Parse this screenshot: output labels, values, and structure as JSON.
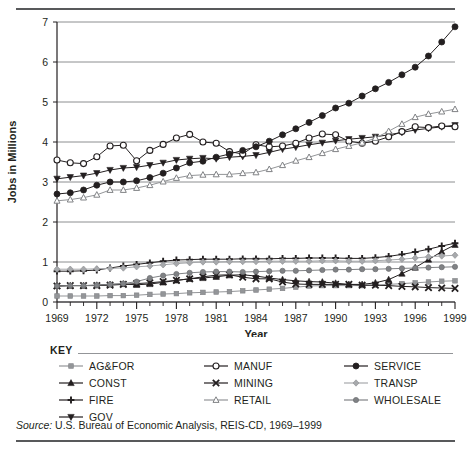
{
  "figure": {
    "source_prefix": "Source:",
    "source_text": " U.S. Bureau of Economic Analysis, REIS-CD, 1969–1999",
    "key_title": "KEY"
  },
  "chart_data": {
    "type": "line",
    "title": "",
    "xlabel": "Year",
    "ylabel": "Jobs in Millions",
    "xlim": [
      1969,
      1999
    ],
    "ylim": [
      0,
      7
    ],
    "yticks": [
      0,
      1,
      2,
      3,
      4,
      5,
      6,
      7
    ],
    "xticks": [
      1969,
      1972,
      1975,
      1978,
      1981,
      1984,
      1987,
      1990,
      1993,
      1996,
      1999
    ],
    "xtick_labels": [
      "1969",
      "1972",
      "1975",
      "1978",
      "1981",
      "1984",
      "1987",
      "1990",
      "1993",
      "1996",
      "1999"
    ],
    "ytick_labels": [
      "0",
      "1",
      "2",
      "3",
      "4",
      "5",
      "6",
      "7"
    ],
    "grid": "horizontal",
    "legend_position": "below-plot",
    "x": [
      1969,
      1970,
      1971,
      1972,
      1973,
      1974,
      1975,
      1976,
      1977,
      1978,
      1979,
      1980,
      1981,
      1982,
      1983,
      1984,
      1985,
      1986,
      1987,
      1988,
      1989,
      1990,
      1991,
      1992,
      1993,
      1994,
      1995,
      1996,
      1997,
      1998,
      1999
    ],
    "series": [
      {
        "name": "AG&FOR",
        "marker": "circle-small-gray",
        "color": "#939598",
        "values": [
          0.15,
          0.15,
          0.15,
          0.15,
          0.16,
          0.16,
          0.17,
          0.19,
          0.2,
          0.21,
          0.23,
          0.24,
          0.25,
          0.26,
          0.28,
          0.3,
          0.32,
          0.34,
          0.37,
          0.4,
          0.41,
          0.41,
          0.41,
          0.41,
          0.42,
          0.44,
          0.46,
          0.48,
          0.5,
          0.52,
          0.53
        ]
      },
      {
        "name": "CONST",
        "marker": "triangle-up",
        "color": "#231f20",
        "values": [
          0.4,
          0.41,
          0.41,
          0.42,
          0.44,
          0.45,
          0.43,
          0.45,
          0.49,
          0.54,
          0.58,
          0.6,
          0.63,
          0.67,
          0.68,
          0.65,
          0.6,
          0.56,
          0.53,
          0.51,
          0.5,
          0.47,
          0.44,
          0.44,
          0.48,
          0.56,
          0.71,
          0.86,
          1.06,
          1.26,
          1.43
        ]
      },
      {
        "name": "FIRE",
        "marker": "plus",
        "color": "#231f20",
        "values": [
          0.77,
          0.77,
          0.78,
          0.8,
          0.85,
          0.9,
          0.94,
          0.98,
          1.02,
          1.05,
          1.06,
          1.07,
          1.07,
          1.07,
          1.08,
          1.08,
          1.08,
          1.09,
          1.09,
          1.1,
          1.1,
          1.1,
          1.09,
          1.09,
          1.11,
          1.14,
          1.19,
          1.25,
          1.32,
          1.4,
          1.47
        ]
      },
      {
        "name": "GOV",
        "marker": "triangle-down",
        "color": "#231f20",
        "values": [
          3.08,
          3.12,
          3.16,
          3.22,
          3.3,
          3.35,
          3.37,
          3.42,
          3.48,
          3.55,
          3.58,
          3.6,
          3.58,
          3.62,
          3.64,
          3.67,
          3.74,
          3.82,
          3.87,
          3.93,
          3.98,
          4.03,
          4.07,
          4.1,
          4.13,
          4.18,
          4.24,
          4.3,
          4.34,
          4.38,
          4.42
        ]
      },
      {
        "name": "MANUF",
        "marker": "circle-open",
        "color": "#231f20",
        "values": [
          3.55,
          3.48,
          3.46,
          3.63,
          3.9,
          3.92,
          3.53,
          3.79,
          3.94,
          4.1,
          4.19,
          4.0,
          3.97,
          3.76,
          3.7,
          3.93,
          3.88,
          3.9,
          3.97,
          4.1,
          4.2,
          4.18,
          4.02,
          3.97,
          4.02,
          4.13,
          4.26,
          4.38,
          4.36,
          4.4,
          4.38
        ]
      },
      {
        "name": "MINING",
        "marker": "cross-x",
        "color": "#231f20",
        "values": [
          0.4,
          0.41,
          0.41,
          0.41,
          0.42,
          0.44,
          0.46,
          0.48,
          0.51,
          0.54,
          0.58,
          0.63,
          0.67,
          0.68,
          0.62,
          0.58,
          0.58,
          0.5,
          0.45,
          0.44,
          0.44,
          0.44,
          0.44,
          0.42,
          0.42,
          0.41,
          0.39,
          0.38,
          0.36,
          0.35,
          0.34
        ]
      },
      {
        "name": "RETAIL",
        "marker": "triangle-open",
        "color": "#939598",
        "values": [
          2.53,
          2.56,
          2.61,
          2.68,
          2.8,
          2.8,
          2.85,
          2.92,
          3.01,
          3.1,
          3.16,
          3.18,
          3.19,
          3.19,
          3.22,
          3.24,
          3.32,
          3.42,
          3.53,
          3.62,
          3.72,
          3.82,
          3.9,
          3.98,
          4.1,
          4.27,
          4.45,
          4.62,
          4.7,
          4.76,
          4.82
        ]
      },
      {
        "name": "SERVICE",
        "marker": "circle-filled",
        "color": "#231f20",
        "values": [
          2.7,
          2.73,
          2.8,
          2.92,
          3.0,
          3.0,
          3.03,
          3.11,
          3.22,
          3.35,
          3.48,
          3.52,
          3.62,
          3.7,
          3.79,
          3.88,
          4.02,
          4.18,
          4.33,
          4.49,
          4.66,
          4.85,
          4.97,
          5.15,
          5.33,
          5.49,
          5.68,
          5.87,
          6.15,
          6.5,
          6.88
        ]
      },
      {
        "name": "TRANSP",
        "marker": "diamond-gray",
        "color": "#a7a9ac",
        "values": [
          0.82,
          0.82,
          0.82,
          0.83,
          0.84,
          0.85,
          0.88,
          0.9,
          0.93,
          0.96,
          0.98,
          1.0,
          1.0,
          1.01,
          1.01,
          1.01,
          1.02,
          1.02,
          1.02,
          1.02,
          1.03,
          1.03,
          1.02,
          1.02,
          1.03,
          1.05,
          1.07,
          1.1,
          1.13,
          1.15,
          1.17
        ]
      },
      {
        "name": "WHOLESALE",
        "marker": "circle-gray",
        "color": "#808285",
        "values": [
          0.4,
          0.41,
          0.41,
          0.42,
          0.44,
          0.46,
          0.51,
          0.6,
          0.66,
          0.7,
          0.73,
          0.75,
          0.76,
          0.76,
          0.75,
          0.76,
          0.77,
          0.78,
          0.78,
          0.79,
          0.8,
          0.81,
          0.81,
          0.82,
          0.82,
          0.83,
          0.84,
          0.85,
          0.86,
          0.87,
          0.88
        ]
      }
    ]
  },
  "legend": {
    "columns": [
      [
        {
          "label": "AG&FOR",
          "marker": "circle-small-gray",
          "color": "#939598"
        },
        {
          "label": "CONST",
          "marker": "triangle-up",
          "color": "#231f20"
        },
        {
          "label": "FIRE",
          "marker": "plus",
          "color": "#231f20"
        },
        {
          "label": "GOV",
          "marker": "triangle-down",
          "color": "#231f20"
        }
      ],
      [
        {
          "label": "MANUF",
          "marker": "circle-open",
          "color": "#231f20"
        },
        {
          "label": "MINING",
          "marker": "cross-x",
          "color": "#231f20"
        },
        {
          "label": "RETAIL",
          "marker": "triangle-open",
          "color": "#939598"
        }
      ],
      [
        {
          "label": "SERVICE",
          "marker": "circle-filled",
          "color": "#231f20"
        },
        {
          "label": "TRANSP",
          "marker": "diamond-gray",
          "color": "#a7a9ac"
        },
        {
          "label": "WHOLESALE",
          "marker": "circle-gray",
          "color": "#808285"
        }
      ]
    ]
  }
}
